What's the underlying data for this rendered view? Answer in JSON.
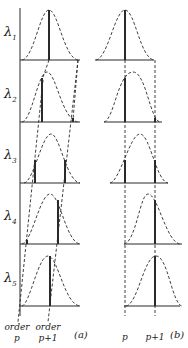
{
  "figure": {
    "wavelength_labels": [
      "λ",
      "λ",
      "λ",
      "λ",
      "λ"
    ],
    "wavelength_subscripts": [
      "1",
      "2",
      "3",
      "4",
      "5"
    ],
    "panel_a": {
      "caption": "(a)",
      "order_p_label_line1": "order",
      "order_p_label_line2": "p",
      "order_p1_label_line1": "order",
      "order_p1_label_line2": "p+1"
    },
    "panel_b": {
      "caption": "(b)",
      "order_p_label": "p",
      "order_p1_label": "p+1"
    },
    "colors": {
      "ink": "#2a2a2a",
      "background": "#ffffff"
    }
  }
}
